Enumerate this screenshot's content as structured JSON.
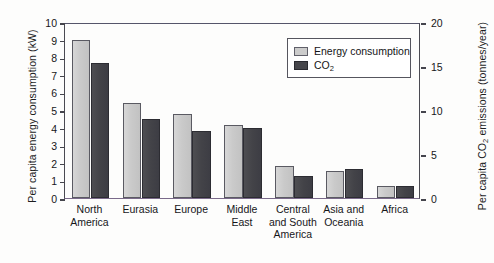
{
  "chart_data": {
    "type": "bar",
    "title": "",
    "categories": [
      "North America",
      "Eurasia",
      "Europe",
      "Middle East",
      "Central and South America",
      "Asia and Oceania",
      "Africa"
    ],
    "category_lines": [
      [
        "North",
        "America"
      ],
      [
        "Eurasia"
      ],
      [
        "Europe"
      ],
      [
        "Middle",
        "East"
      ],
      [
        "Central",
        "and South",
        "America"
      ],
      [
        "Asia and",
        "Oceania"
      ],
      [
        "Africa"
      ]
    ],
    "series": [
      {
        "name": "Energy consumption",
        "axis": "left",
        "unit": "kW",
        "color": "#cacaca",
        "values": [
          9.0,
          5.4,
          4.75,
          4.15,
          1.8,
          1.55,
          0.7
        ]
      },
      {
        "name": "CO2",
        "axis": "right",
        "unit": "tonnes/year",
        "color": "#44444a",
        "values_left_scale": [
          7.65,
          4.5,
          3.8,
          4.0,
          1.25,
          1.65,
          0.7
        ],
        "values": [
          15.3,
          9.0,
          7.6,
          8.0,
          2.5,
          3.3,
          1.4
        ]
      }
    ],
    "xlabel": "",
    "ylabel_left": "Per capita energy consumption (kW)",
    "ylabel_right_pre": "Per capita CO",
    "ylabel_right_sub": "2",
    "ylabel_right_post": " emissions (tonnes/year)",
    "ylim_left": [
      0,
      10
    ],
    "ylim_right": [
      0,
      20
    ],
    "yticks_left": [
      "0",
      "1",
      "2",
      "3",
      "4",
      "5",
      "6",
      "7",
      "8",
      "9",
      "10"
    ],
    "yticks_right": [
      "0",
      "5",
      "10",
      "15",
      "20"
    ],
    "grid": false,
    "legend_position": "top-right"
  },
  "legend": {
    "items": [
      {
        "label": "Energy consumption",
        "swatch": "light"
      },
      {
        "label_pre": "CO",
        "label_sub": "2",
        "swatch": "dark"
      }
    ]
  }
}
